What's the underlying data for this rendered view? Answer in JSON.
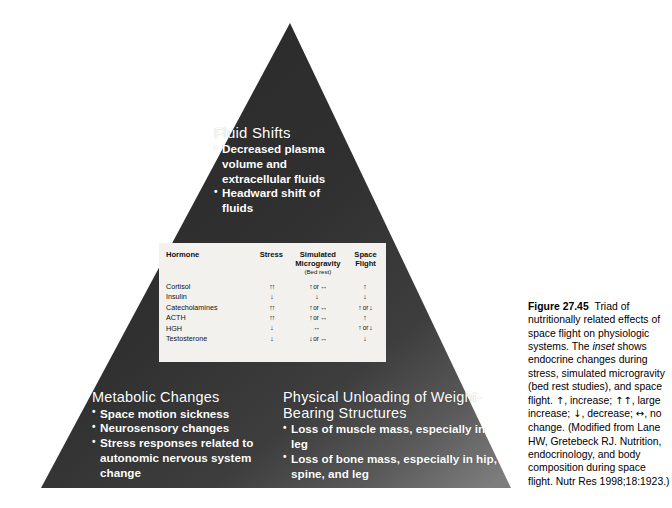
{
  "figure": {
    "label": "Figure",
    "number": "27.45",
    "caption_part1": "Triad of nutritionally related effects of space flight on physiologic systems. The ",
    "caption_italic": "inset",
    "caption_part2": " shows endocrine changes during stress, simulated microgravity (bed rest studies), and space flight. ",
    "legend_up": "↑",
    "legend_up_text": ", increase; ",
    "legend_doubleup": "↑↑",
    "legend_doubleup_text": ", large increase; ",
    "legend_down": "↓",
    "legend_down_text": ", decrease; ",
    "legend_lr": "↔",
    "legend_lr_text": ", no change. ",
    "source": "(Modified from Lane HW, Gretebeck RJ. Nutrition, endocrinology, and body composition during space flight. Nutr Res 1998;18:1923.)"
  },
  "triangle": {
    "fill_dark": "#2b2b2b",
    "fill_light": "#6f6f6f",
    "text_color": "#ffffff"
  },
  "blocks": {
    "fluid_shifts": {
      "title": "Fluid Shifts",
      "items": [
        "Decreased plasma volume and extracellular fluids",
        "Headward shift of fluids"
      ]
    },
    "metabolic_changes": {
      "title": "Metabolic Changes",
      "items": [
        "Space motion sickness",
        "Neurosensory changes",
        "Stress responses related to autonomic nervous system change"
      ]
    },
    "physical_unloading": {
      "title": "Physical Unloading of Weight-Bearing Structures",
      "items": [
        "Loss of muscle mass, especially in leg",
        "Loss of bone mass, especially in hip, spine, and leg"
      ]
    }
  },
  "inset_table": {
    "headers": {
      "hormone": "Hormone",
      "stress": "Stress",
      "simulated": "Simulated Microgravity",
      "simulated_sub": "(Bed rest)",
      "space": "Space Flight"
    },
    "rows": [
      {
        "hormone": "Cortisol",
        "stress": "↑↑",
        "simulated_a": "↑",
        "simulated_or": "or",
        "simulated_b": "↔",
        "space_a": "↑",
        "space_or": "",
        "space_b": ""
      },
      {
        "hormone": "Insulin",
        "stress": "↓",
        "simulated_a": "↓",
        "simulated_or": "",
        "simulated_b": "",
        "space_a": "↓",
        "space_or": "",
        "space_b": ""
      },
      {
        "hormone": "Catecholamines",
        "stress": "↑↑",
        "simulated_a": "↑",
        "simulated_or": "or",
        "simulated_b": "↔",
        "space_a": "↑",
        "space_or": "or",
        "space_b": "↓"
      },
      {
        "hormone": "ACTH",
        "stress": "↑↑",
        "simulated_a": "↑",
        "simulated_or": "or",
        "simulated_b": "↔",
        "space_a": "↑",
        "space_or": "",
        "space_b": ""
      },
      {
        "hormone": "HGH",
        "stress": "↓",
        "simulated_a": "↔",
        "simulated_or": "",
        "simulated_b": "",
        "space_a": "↑",
        "space_or": "or",
        "space_b": "↓"
      },
      {
        "hormone": "Testosterone",
        "stress": "↓",
        "simulated_a": "↓",
        "simulated_or": "or",
        "simulated_b": "↔",
        "space_a": "↓",
        "space_or": "",
        "space_b": ""
      }
    ]
  }
}
